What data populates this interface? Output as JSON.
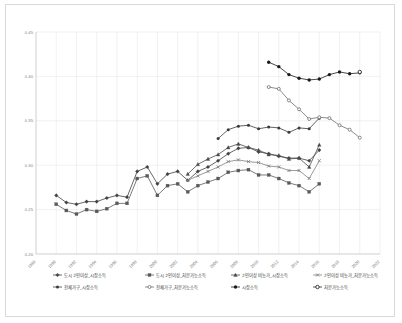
{
  "chart_data": {
    "type": "line",
    "title": "",
    "xlabel": "",
    "ylabel": "",
    "xlim": [
      1988,
      2022
    ],
    "ylim": [
      0.2,
      0.45
    ],
    "grid": true,
    "legend_position": "bottom",
    "x_ticks": [
      1988,
      1990,
      1992,
      1994,
      1996,
      1998,
      2000,
      2002,
      2004,
      2006,
      2008,
      2010,
      2012,
      2014,
      2016,
      2018,
      2020,
      2022
    ],
    "y_ticks": [
      0.2,
      0.25,
      0.3,
      0.35,
      0.4,
      0.45
    ],
    "y_tick_labels": [
      "0.20",
      "0.25",
      "0.30",
      "0.35",
      "0.40",
      "0.45"
    ],
    "x_tick_labels": [
      "1988",
      "1990",
      "1992",
      "1994",
      "1996",
      "1998",
      "2000",
      "2002",
      "2004",
      "2006",
      "2008",
      "2010",
      "2012",
      "2014",
      "2016",
      "2018",
      "2020",
      "2022"
    ],
    "series": [
      {
        "name": "도시 2인이상_시장소득",
        "marker": "diamond",
        "color": "#404040",
        "x": [
          1990,
          1991,
          1992,
          1993,
          1994,
          1995,
          1996,
          1997,
          1998,
          1999,
          2000,
          2001,
          2002,
          2003,
          2004,
          2005,
          2006,
          2007,
          2008,
          2009,
          2010,
          2011,
          2012,
          2013,
          2014,
          2015,
          2016
        ],
        "values": [
          0.266,
          0.258,
          0.256,
          0.259,
          0.259,
          0.263,
          0.266,
          0.264,
          0.293,
          0.298,
          0.279,
          0.29,
          0.293,
          0.283,
          0.293,
          0.298,
          0.305,
          0.313,
          0.319,
          0.32,
          0.315,
          0.313,
          0.31,
          0.308,
          0.308,
          0.305,
          0.317
        ]
      },
      {
        "name": "도시 2인이상_처분가능소득",
        "marker": "square",
        "color": "#595959",
        "x": [
          1990,
          1991,
          1992,
          1993,
          1994,
          1995,
          1996,
          1997,
          1998,
          1999,
          2000,
          2001,
          2002,
          2003,
          2004,
          2005,
          2006,
          2007,
          2008,
          2009,
          2010,
          2011,
          2012,
          2013,
          2014,
          2015,
          2016
        ],
        "values": [
          0.256,
          0.249,
          0.245,
          0.25,
          0.248,
          0.251,
          0.257,
          0.257,
          0.285,
          0.288,
          0.266,
          0.277,
          0.279,
          0.27,
          0.277,
          0.281,
          0.285,
          0.292,
          0.294,
          0.295,
          0.289,
          0.289,
          0.285,
          0.28,
          0.277,
          0.27,
          0.279
        ]
      },
      {
        "name": "2인이상 비농가_시장소득",
        "marker": "triangle",
        "color": "#4a4a4a",
        "x": [
          2003,
          2004,
          2005,
          2006,
          2007,
          2008,
          2009,
          2010,
          2011,
          2012,
          2013,
          2014,
          2015,
          2016
        ],
        "values": [
          0.29,
          0.301,
          0.307,
          0.312,
          0.32,
          0.324,
          0.32,
          0.317,
          0.312,
          0.311,
          0.307,
          0.308,
          0.298,
          0.323
        ]
      },
      {
        "name": "2인이상 비농가_처분가능소득",
        "marker": "cross",
        "color": "#808080",
        "x": [
          2003,
          2004,
          2005,
          2006,
          2007,
          2008,
          2009,
          2010,
          2011,
          2012,
          2013,
          2014,
          2015,
          2016
        ],
        "values": [
          0.283,
          0.288,
          0.293,
          0.298,
          0.304,
          0.306,
          0.304,
          0.303,
          0.299,
          0.298,
          0.294,
          0.294,
          0.285,
          0.305
        ]
      },
      {
        "name": "전체가구_시장소득",
        "marker": "circle",
        "color": "#3a3a3a",
        "x": [
          2006,
          2007,
          2008,
          2009,
          2010,
          2011,
          2012,
          2013,
          2014,
          2015,
          2016
        ],
        "values": [
          0.33,
          0.34,
          0.344,
          0.345,
          0.341,
          0.343,
          0.342,
          0.337,
          0.342,
          0.341,
          0.353
        ]
      },
      {
        "name": "전체가구_처분가능소득",
        "marker": "circle-open",
        "color": "#6e6e6e",
        "x": [
          2011,
          2012,
          2013,
          2014,
          2015,
          2016,
          2017,
          2018,
          2019,
          2020
        ],
        "values": [
          0.388,
          0.386,
          0.373,
          0.363,
          0.352,
          0.354,
          0.353,
          0.345,
          0.34,
          0.331
        ]
      },
      {
        "name": "시장소득",
        "marker": "dot",
        "color": "#1a1a1a",
        "x": [
          2011,
          2012,
          2013,
          2014,
          2015,
          2016,
          2017,
          2018,
          2019,
          2020
        ],
        "values": [
          0.416,
          0.411,
          0.402,
          0.398,
          0.396,
          0.397,
          0.402,
          0.405,
          0.403,
          0.404
        ]
      },
      {
        "name": "처분가능소득",
        "marker": "dot-open",
        "color": "#2b2b2b",
        "x": [
          2020
        ],
        "values": [
          0.405
        ]
      }
    ]
  },
  "legend": {
    "rows": [
      [
        "도시 2인이상_시장소득",
        "도시 2인이상_처분가능소득",
        "2인이상 비농가_시장소득",
        "2인이상 비농가_처분가능소득"
      ],
      [
        "전체가구_시장소득",
        "전체가구_처분가능소득",
        "시장소득",
        "처분가능소득"
      ]
    ]
  }
}
